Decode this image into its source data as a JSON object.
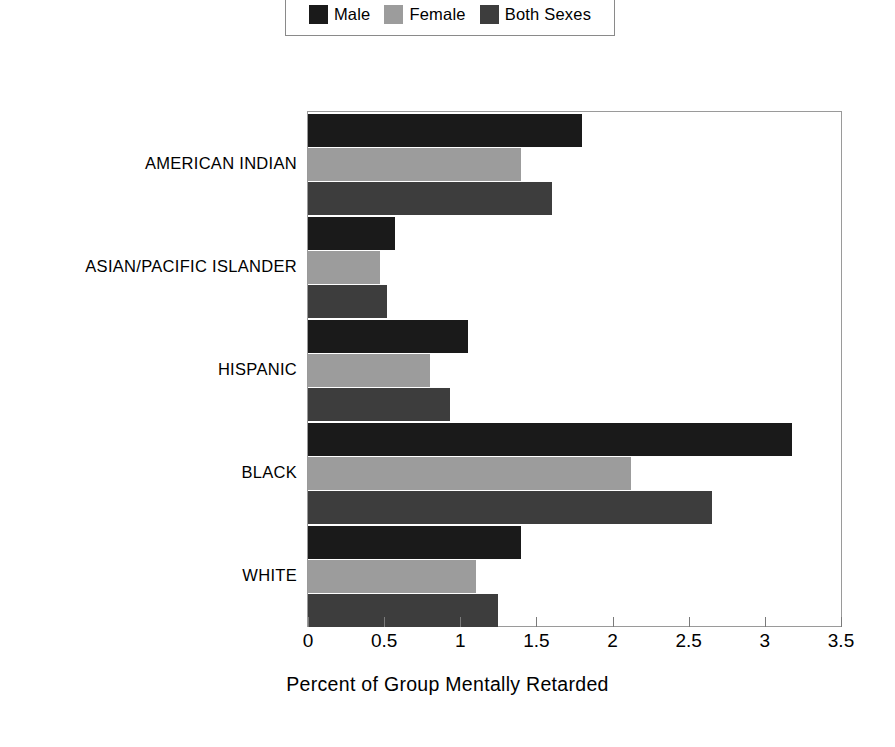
{
  "chart_data": {
    "type": "bar",
    "orientation": "horizontal",
    "title": "",
    "xlabel": "Percent of Group Mentally Retarded",
    "ylabel": "",
    "xlim": [
      0,
      3.5
    ],
    "xticks": [
      0,
      0.5,
      1,
      1.5,
      2,
      2.5,
      3,
      3.5
    ],
    "xtick_labels": [
      "0",
      "0.5",
      "1",
      "1.5",
      "2",
      "2.5",
      "3",
      "3.5"
    ],
    "grid": false,
    "legend_position": "top-center",
    "categories": [
      "AMERICAN INDIAN",
      "ASIAN/PACIFIC ISLANDER",
      "HISPANIC",
      "BLACK",
      "WHITE"
    ],
    "series": [
      {
        "name": "Male",
        "color": "#1a1a1a",
        "values": [
          1.8,
          0.57,
          1.05,
          3.18,
          1.4
        ]
      },
      {
        "name": "Female",
        "color": "#9c9c9c",
        "values": [
          1.4,
          0.47,
          0.8,
          2.12,
          1.1
        ]
      },
      {
        "name": "Both Sexes",
        "color": "#3d3d3d",
        "values": [
          1.6,
          0.52,
          0.93,
          2.65,
          1.25
        ]
      }
    ]
  },
  "legend": {
    "entries": [
      {
        "label": "Male",
        "color": "#1a1a1a"
      },
      {
        "label": "Female",
        "color": "#9c9c9c"
      },
      {
        "label": "Both Sexes",
        "color": "#3d3d3d"
      }
    ]
  },
  "axis": {
    "x_title": "Percent of Group Mentally Retarded"
  }
}
